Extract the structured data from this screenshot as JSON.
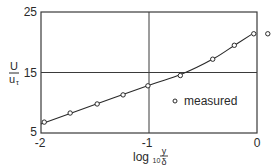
{
  "chart_data": {
    "type": "scatter",
    "title": "",
    "xlabel": "log10 y/δ",
    "ylabel": "U/u_τ",
    "xlim": [
      -2,
      0
    ],
    "ylim": [
      5,
      25
    ],
    "x_ticks": [
      "-2",
      "-1",
      "0"
    ],
    "y_ticks": [
      "5",
      "15",
      "25"
    ],
    "grid": {
      "x": [
        -1
      ],
      "y": [
        15
      ]
    },
    "legend": {
      "position": "lower-right inside",
      "entries": [
        "measured"
      ]
    },
    "series": [
      {
        "name": "measured",
        "marker": "open-circle",
        "x": [
          -1.97,
          -1.73,
          -1.48,
          -1.24,
          -1.01,
          -0.71,
          -0.41,
          -0.21,
          -0.03,
          0.1
        ],
        "y": [
          6.8,
          8.3,
          9.8,
          11.3,
          12.8,
          14.5,
          17.2,
          19.5,
          21.4,
          21.4
        ]
      },
      {
        "name": "fit",
        "style": "solid-line",
        "x": [
          -2.0,
          -1.5,
          -1.0,
          -0.7,
          -0.4,
          -0.2,
          -0.05
        ],
        "y": [
          6.5,
          9.7,
          12.9,
          14.7,
          17.3,
          19.6,
          21.3
        ]
      }
    ]
  },
  "labels": {
    "y_num": "U",
    "y_den": "u",
    "y_den_sub": "τ",
    "x_log": "log",
    "x_sub": "10",
    "x_num": "y",
    "x_den": "δ",
    "legend": "measured",
    "tick_x0": "-2",
    "tick_x1": "-1",
    "tick_x2": "0",
    "tick_y0": "5",
    "tick_y1": "15",
    "tick_y2": "25"
  }
}
